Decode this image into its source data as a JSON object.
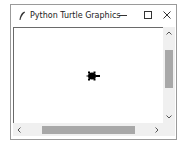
{
  "window": {
    "title": "Python Turtle Graphics",
    "app_icon": "feather-icon",
    "controls": {
      "minimize": "minimize-icon",
      "maximize": "maximize-icon",
      "close": "close-icon"
    }
  },
  "canvas": {
    "background": "#ffffff",
    "turtle": {
      "shape": "turtle",
      "color": "#000000",
      "heading": "east"
    }
  },
  "scrollbars": {
    "vertical": {
      "up_arrow": "chevron-up-icon",
      "down_arrow": "chevron-down-icon",
      "thumb_color": "#a8a8a8"
    },
    "horizontal": {
      "left_arrow": "chevron-left-icon",
      "right_arrow": "chevron-right-icon",
      "thumb_color": "#a8a8a8"
    }
  }
}
